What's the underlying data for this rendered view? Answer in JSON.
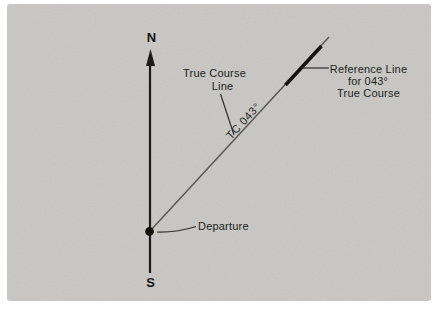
{
  "diagram_title": "true-course-plotting-diagram",
  "compass": {
    "north": "N",
    "south": "S"
  },
  "labels": {
    "true_course": {
      "line1": "True Course",
      "line2": "Line"
    },
    "tc": "TC 043°",
    "reference": {
      "line1": "Reference Line",
      "line2": "for 043°",
      "line3": "True Course"
    },
    "departure": "Departure"
  },
  "colors": {
    "page_background": "#ffffff",
    "diagram_background": "#c8c7c4",
    "ink": "#201f1d",
    "course_line": "#5b5854",
    "reference_segment": "#141312"
  }
}
